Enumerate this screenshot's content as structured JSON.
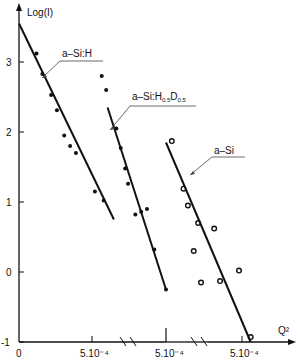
{
  "chart_data": {
    "type": "scatter",
    "title": "",
    "ylabel": "Log(I)",
    "xlabel": "Q²",
    "ylim": [
      -1,
      3.6
    ],
    "y_ticks": [
      3,
      2,
      1,
      0,
      -1
    ],
    "x_tick_labels": [
      "0",
      "5.10⁻⁴",
      "5.10⁻⁴",
      "5.10⁻⁴"
    ],
    "x_axis_note": "Broken x-axis: three panels, each shifted; break marks between panels",
    "grid": false,
    "legend": "inline callout labels",
    "series": [
      {
        "name": "a-Si:H",
        "marker": "filled-dot",
        "fit_line": {
          "x": [
            0,
            0.00065
          ],
          "y": [
            3.55,
            0.75
          ]
        },
        "points": [
          {
            "x": 0.00012,
            "y": 3.12
          },
          {
            "x": 0.00016,
            "y": 2.83
          },
          {
            "x": 0.00022,
            "y": 2.53
          },
          {
            "x": 0.00026,
            "y": 2.31
          },
          {
            "x": 0.00031,
            "y": 1.95
          },
          {
            "x": 0.00035,
            "y": 1.8
          },
          {
            "x": 0.00039,
            "y": 1.7
          },
          {
            "x": 0.00052,
            "y": 1.15
          },
          {
            "x": 0.00058,
            "y": 1.02
          }
        ]
      },
      {
        "name": "a-Si:H0.5D0.5",
        "marker": "filled-dot",
        "fit_line": {
          "x": [
            0.0001,
            0.0005
          ],
          "y": [
            2.35,
            -0.25
          ]
        },
        "points": [
          {
            "x": 6e-05,
            "y": 2.8
          },
          {
            "x": 9e-05,
            "y": 2.6
          },
          {
            "x": 0.00016,
            "y": 2.05
          },
          {
            "x": 0.00019,
            "y": 1.77
          },
          {
            "x": 0.00022,
            "y": 1.48
          },
          {
            "x": 0.00024,
            "y": 1.26
          },
          {
            "x": 0.00029,
            "y": 0.82
          },
          {
            "x": 0.00033,
            "y": 0.86
          },
          {
            "x": 0.00037,
            "y": 0.9
          },
          {
            "x": 0.00042,
            "y": 0.32
          },
          {
            "x": 0.0005,
            "y": -0.25
          }
        ]
      },
      {
        "name": "a-Si",
        "marker": "open-circle",
        "fit_line": {
          "x": [
            0.0,
            0.00058
          ],
          "y": [
            1.85,
            -1.0
          ]
        },
        "points": [
          {
            "x": 4e-05,
            "y": 1.87
          },
          {
            "x": 0.00012,
            "y": 1.19
          },
          {
            "x": 0.00015,
            "y": 0.95
          },
          {
            "x": 0.00019,
            "y": 0.3
          },
          {
            "x": 0.00022,
            "y": 0.7
          },
          {
            "x": 0.00024,
            "y": -0.15
          },
          {
            "x": 0.00033,
            "y": 0.62
          },
          {
            "x": 0.00037,
            "y": -0.13
          },
          {
            "x": 0.0005,
            "y": 0.02
          },
          {
            "x": 0.00058,
            "y": -0.93
          }
        ]
      }
    ]
  },
  "layout": {
    "y_px_per_unit": 70,
    "y0_px": 272,
    "panels": [
      {
        "x0_px": 19,
        "px_per_1e4": 14.6
      },
      {
        "x0_px": 93,
        "px_per_1e4": 14.6
      },
      {
        "x0_px": 166,
        "px_per_1e4": 14.6
      }
    ]
  }
}
